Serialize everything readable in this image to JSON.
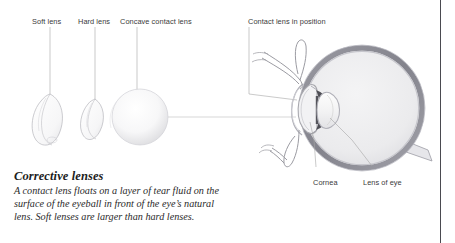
{
  "figure": {
    "kind": "anatomical-illustration"
  },
  "callouts": [
    {
      "id": "soft-lens",
      "label": "Soft lens"
    },
    {
      "id": "hard-lens",
      "label": "Hard lens"
    },
    {
      "id": "concave-contact-lens",
      "label": "Concave contact lens"
    },
    {
      "id": "contact-lens-in-position",
      "label": "Contact lens in position"
    },
    {
      "id": "cornea",
      "label": "Cornea"
    },
    {
      "id": "lens-of-eye",
      "label": "Lens of eye"
    }
  ],
  "caption": {
    "title": "Corrective lenses",
    "lines": [
      "A contact lens floats on a layer of tear fluid on the",
      "surface of the eyeball in front of the eye’s natural",
      "lens. Soft lenses are larger than hard lenses."
    ]
  },
  "colors": {
    "page_background": "#ffffff",
    "page_rule": "#4a4a50",
    "label_text": "#3a3a3a",
    "caption_title": "#1d1d1d",
    "caption_body": "#2a2a2a",
    "leader_line": "#9a9a9a",
    "sclera_ring": "#8e8e96",
    "vitreous_fill": "#ececee",
    "cornea_outline": "#a8a8ae",
    "lens_fill": "#f4f4f5",
    "iris_dark": "#4a4a50",
    "lens_outline": "#b4b4ba",
    "eyelid_outline": "#9b9ba2",
    "sphere_shade": "#e6e6e8"
  }
}
